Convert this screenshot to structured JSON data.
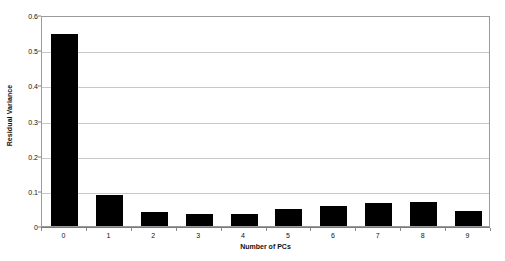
{
  "chart_data": {
    "type": "bar",
    "title": "",
    "xlabel": "Number of PCs",
    "ylabel": "Residual Variance",
    "categories": [
      "0",
      "1",
      "2",
      "3",
      "4",
      "5",
      "6",
      "7",
      "8",
      "9"
    ],
    "values": [
      0.545,
      0.088,
      0.04,
      0.034,
      0.035,
      0.047,
      0.056,
      0.065,
      0.068,
      0.042
    ],
    "series": [
      {
        "name": "Residual Variance",
        "values": [
          0.545,
          0.088,
          0.04,
          0.034,
          0.035,
          0.047,
          0.056,
          0.065,
          0.068,
          0.042
        ]
      }
    ],
    "ylim": [
      0,
      0.6
    ],
    "yticks": [
      0,
      0.1,
      0.2,
      0.3,
      0.4,
      0.5,
      0.6
    ],
    "ytick_labels": [
      "0",
      "0.1",
      "0.2",
      "0.3",
      "0.4",
      "0.5",
      "0.6"
    ],
    "grid": true,
    "grid_axis": "y",
    "legend": false,
    "legend_position": "none",
    "bar_color": "#000000",
    "gridline_color": "#c8c8c8",
    "plot_border_color": "#9a9a9a",
    "background_color": "#ffffff"
  },
  "axes": {
    "y_title": "Residual Variance",
    "x_title": "Number of PCs"
  }
}
